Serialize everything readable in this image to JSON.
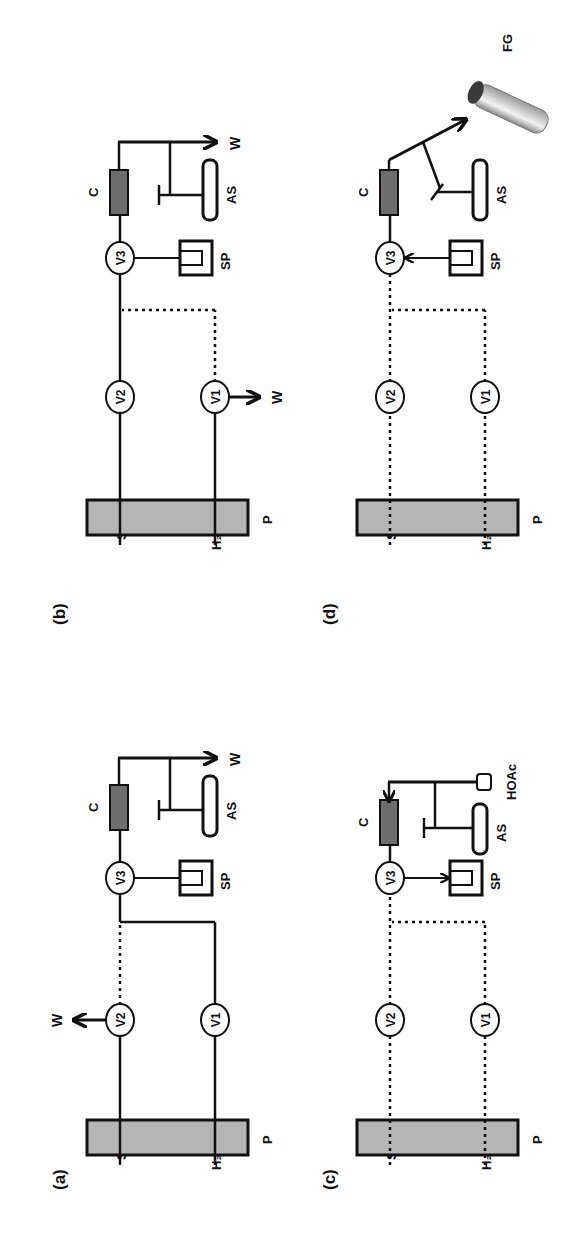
{
  "figure": {
    "orientation": "rotated-90-ccw",
    "colors": {
      "line": "#111111",
      "pump_fill": "#b5b5b5",
      "column_fill": "#6e6e6e",
      "background": "#ffffff"
    },
    "panels": [
      {
        "id": "a",
        "label": "(a)",
        "inputs": {
          "sample": "S",
          "water": "H₂O"
        },
        "pump": "P",
        "valves": [
          "V1",
          "V2",
          "V3"
        ],
        "column": "C",
        "sample_probe": "SP",
        "autosampler": "AS",
        "waste_labels": [
          "W",
          "W"
        ],
        "description": "V2 to waste; H2O via V1 through V3 and C to waste"
      },
      {
        "id": "b",
        "label": "(b)",
        "inputs": {
          "sample": "S",
          "water": "H₂O"
        },
        "pump": "P",
        "valves": [
          "V1",
          "V2",
          "V3"
        ],
        "column": "C",
        "sample_probe": "SP",
        "autosampler": "AS",
        "waste_labels": [
          "W",
          "W"
        ],
        "description": "S via V2 through V3 and C to waste; V1 to waste"
      },
      {
        "id": "c",
        "label": "(c)",
        "inputs": {
          "sample": "S",
          "water": "H₂O"
        },
        "pump": "P",
        "valves": [
          "V1",
          "V2",
          "V3"
        ],
        "column": "C",
        "sample_probe": "SP",
        "autosampler": "AS",
        "reagent": "HOAc",
        "description": "HOAc drawn back through C and V3 into SP"
      },
      {
        "id": "d",
        "label": "(d)",
        "inputs": {
          "sample": "S",
          "water": "H₂O"
        },
        "pump": "P",
        "valves": [
          "V1",
          "V2",
          "V3"
        ],
        "column": "C",
        "sample_probe": "SP",
        "autosampler": "AS",
        "collector": "FG",
        "description": "SP pushes through V3 and C into FG"
      }
    ]
  }
}
